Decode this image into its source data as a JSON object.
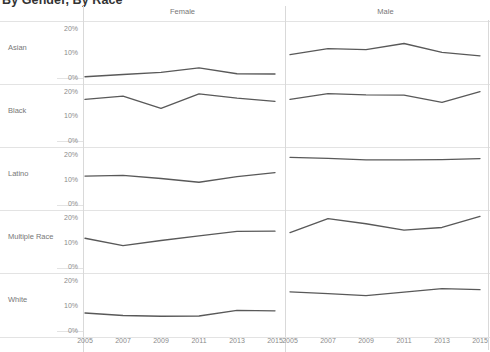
{
  "title": "By Gender, By Race",
  "columns": [
    {
      "id": "female",
      "label": "Female"
    },
    {
      "id": "male",
      "label": "Male"
    }
  ],
  "rows": [
    {
      "id": "asian",
      "label": "Asian"
    },
    {
      "id": "black",
      "label": "Black"
    },
    {
      "id": "latino",
      "label": "Latino"
    },
    {
      "id": "multiple-race",
      "label": "Multiple Race"
    },
    {
      "id": "white",
      "label": "White"
    }
  ],
  "axis": {
    "y_ticks": [
      "0%",
      "10%",
      "20%"
    ],
    "y_values": [
      0,
      10,
      20
    ],
    "y_min": 0,
    "y_max": 22,
    "x_ticks": [
      "2005",
      "2007",
      "2009",
      "2011",
      "2013",
      "2015"
    ],
    "x_values": [
      2005,
      2007,
      2009,
      2011,
      2013,
      2015
    ]
  },
  "style": {
    "line_color": "#595959",
    "grid_color": "#e3e3e3",
    "text_color": "#777777",
    "tick_color": "#8a8a8a",
    "background": "#ffffff"
  },
  "chart_data": {
    "type": "line",
    "title": "By Gender, By Race",
    "xlabel": "",
    "ylabel": "",
    "xlim": [
      2005,
      2015
    ],
    "ylim": [
      0,
      22
    ],
    "grid": false,
    "legend": null,
    "layout": "small-multiples 5 rows (race) x 2 columns (gender)",
    "row_facets": [
      "Asian",
      "Black",
      "Latino",
      "Multiple Race",
      "White"
    ],
    "column_facets": [
      "Female",
      "Male"
    ],
    "x": [
      2005,
      2007,
      2009,
      2011,
      2013,
      2015
    ],
    "panels": [
      {
        "row": "Asian",
        "column": "Female",
        "series": [
          {
            "name": "Asian / Female",
            "values": [
              0.6,
              1.5,
              2.4,
              4.2,
              1.8,
              1.7
            ]
          }
        ]
      },
      {
        "row": "Asian",
        "column": "Male",
        "series": [
          {
            "name": "Asian / Male",
            "values": [
              9.6,
              12.0,
              11.6,
              14.1,
              10.5,
              9.1
            ]
          }
        ]
      },
      {
        "row": "Black",
        "column": "Female",
        "series": [
          {
            "name": "Black / Female",
            "values": [
              17.1,
              18.4,
              13.4,
              19.3,
              17.6,
              16.3
            ]
          }
        ]
      },
      {
        "row": "Black",
        "column": "Male",
        "series": [
          {
            "name": "Black / Male",
            "values": [
              17.1,
              19.4,
              18.9,
              18.8,
              15.9,
              20.2
            ]
          }
        ]
      },
      {
        "row": "Latino",
        "column": "Female",
        "series": [
          {
            "name": "Latino / Female",
            "values": [
              11.6,
              11.9,
              10.6,
              9.1,
              11.4,
              13.0
            ]
          }
        ]
      },
      {
        "row": "Latino",
        "column": "Male",
        "series": [
          {
            "name": "Latino / Male",
            "values": [
              19.2,
              18.8,
              18.2,
              18.2,
              18.3,
              18.7
            ]
          }
        ]
      },
      {
        "row": "Multiple Race",
        "column": "Female",
        "series": [
          {
            "name": "Multiple Race / Female",
            "values": [
              12.0,
              9.0,
              11.1,
              13.0,
              14.8,
              14.9
            ]
          }
        ]
      },
      {
        "row": "Multiple Race",
        "column": "Male",
        "series": [
          {
            "name": "Multiple Race / Male",
            "values": [
              14.3,
              20.0,
              17.9,
              15.3,
              16.4,
              20.9
            ]
          }
        ]
      },
      {
        "row": "White",
        "column": "Female",
        "series": [
          {
            "name": "White / Female",
            "values": [
              7.3,
              6.3,
              6.0,
              6.1,
              8.4,
              8.2
            ]
          }
        ]
      },
      {
        "row": "White",
        "column": "Male",
        "series": [
          {
            "name": "White / Male",
            "values": [
              15.9,
              15.2,
              14.4,
              15.8,
              17.2,
              16.8
            ]
          }
        ]
      }
    ]
  }
}
